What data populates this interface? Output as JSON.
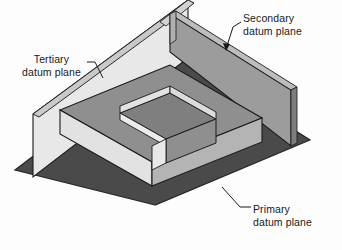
{
  "figure": {
    "background_color": "#fdfdfd"
  },
  "labels": {
    "secondary": {
      "line1": "Secondary",
      "line2": "datum plane"
    },
    "tertiary": {
      "line1": "Tertiary",
      "line2": "datum plane"
    },
    "primary": {
      "line1": "Primary",
      "line2": "datum plane"
    }
  },
  "colors": {
    "base_plane": "#4a4a4a",
    "base_plane_edge": "#2b2b2b",
    "light_plane": "#e8e8e8",
    "light_plane_shadow": "#c9c9c9",
    "mid_gray": "#8a8a8a",
    "mid_gray_dark": "#6e6e6e",
    "block_top": "#8f8f8f",
    "block_face_light": "#e2e2e2",
    "block_face_mid": "#b4b4b4",
    "outline": "#1a1a1a",
    "text": "#1a1a1a"
  },
  "geometry": {
    "view": "isometric",
    "base_plane_corners": [
      [
        155,
        205
      ],
      [
        15,
        170
      ],
      [
        170,
        52
      ],
      [
        310,
        140
      ]
    ],
    "planes": [
      {
        "name": "primary-datum-plane",
        "orientation": "horizontal",
        "shade": "dark"
      },
      {
        "name": "secondary-datum-plane",
        "orientation": "vertical",
        "shade": "mid"
      },
      {
        "name": "tertiary-datum-plane",
        "orientation": "vertical",
        "shade": "light"
      }
    ],
    "part": {
      "name": "u-shaped-block",
      "pocket": "open-ended-slot"
    }
  }
}
